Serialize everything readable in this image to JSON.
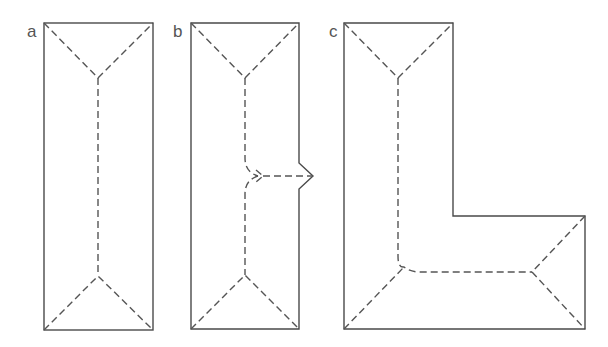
{
  "figure": {
    "stroke_color": "#4a4a4a",
    "ridge_color": "#555555",
    "panels": [
      {
        "id": "a",
        "label": "a",
        "shape": "rectangle"
      },
      {
        "id": "b",
        "label": "b",
        "shape": "rectangle-with-notch"
      },
      {
        "id": "c",
        "label": "c",
        "shape": "L-shape"
      }
    ]
  }
}
